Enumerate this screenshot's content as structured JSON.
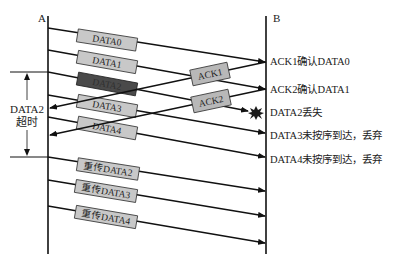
{
  "hosts": {
    "sender": "A",
    "receiver": "B"
  },
  "timeout_label": {
    "line1": "DATA2",
    "line2": "超时"
  },
  "frames": [
    {
      "label": "DATA0",
      "style": "normal"
    },
    {
      "label": "DATA1",
      "style": "normal"
    },
    {
      "label": "DATA2",
      "style": "dark"
    },
    {
      "label": "DATA3",
      "style": "normal"
    },
    {
      "label": "DATA4",
      "style": "normal"
    },
    {
      "label": "重传DATA2",
      "style": "normal"
    },
    {
      "label": "重传DATA3",
      "style": "normal"
    },
    {
      "label": "重传DATA4",
      "style": "normal"
    }
  ],
  "acks": [
    {
      "label": "ACK1"
    },
    {
      "label": "ACK2"
    }
  ],
  "receiver_notes": [
    "ACK1确认DATA0",
    "ACK2确认DATA1",
    "DATA2丢失",
    "DATA3未按序到达，丢弃",
    "DATA4未按序到达，丢弃"
  ],
  "colors": {
    "box_fill": "#c8c8c8",
    "box_dark": "#4a4a4a",
    "line": "#111111",
    "loss_burst": "#1a1a1a"
  }
}
